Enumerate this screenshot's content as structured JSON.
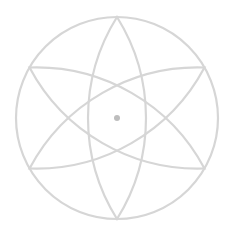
{
  "figure": {
    "type": "geometric-rosette",
    "center": [
      117,
      118
    ],
    "outer_radius": 101,
    "lens_count": 3,
    "lens_rotations_deg": [
      0,
      60,
      120
    ],
    "lens_half_width": 29,
    "stroke_color": "#d6d6d6",
    "stroke_width": 2.2,
    "center_dot_color": "#bdbdbd",
    "center_dot_radius": 3
  }
}
